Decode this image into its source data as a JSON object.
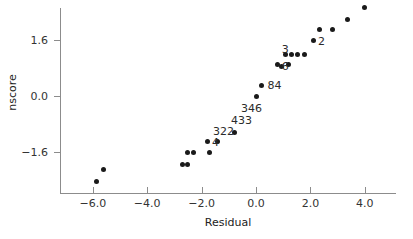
{
  "chart_data": {
    "type": "scatter",
    "title": "",
    "xlabel": "Residual",
    "ylabel": "nscore",
    "xlim": [
      -7.3,
      5.1
    ],
    "ylim": [
      -2.9,
      2.7
    ],
    "xticks": [
      -6.0,
      -4.0,
      -2.0,
      0.0,
      2.0,
      4.0
    ],
    "xtick_labels": [
      "−6.0",
      "−4.0",
      "−2.0",
      "0.0",
      "2.0",
      "4.0"
    ],
    "yticks": [
      1.6,
      0.0,
      -1.6
    ],
    "ytick_labels": [
      "1.6",
      "0.0",
      "−1.6"
    ],
    "grid": false,
    "legend": null,
    "marker": "filled-circle",
    "marker_color": "#1a1a1a",
    "axis_color": "#8c8c8c",
    "points": [
      {
        "x": -5.85,
        "y": -2.45
      },
      {
        "x": -5.6,
        "y": -2.1
      },
      {
        "x": -2.7,
        "y": -1.95
      },
      {
        "x": -2.52,
        "y": -1.95
      },
      {
        "x": -2.52,
        "y": -1.62
      },
      {
        "x": -2.3,
        "y": -1.62
      },
      {
        "x": -1.72,
        "y": -1.62
      },
      {
        "x": -1.78,
        "y": -1.3
      },
      {
        "x": -1.4,
        "y": -1.3
      },
      {
        "x": -0.8,
        "y": -1.05
      },
      {
        "x": 0.0,
        "y": 0.0
      },
      {
        "x": 0.2,
        "y": 0.3
      },
      {
        "x": 0.78,
        "y": 0.9
      },
      {
        "x": 0.92,
        "y": 0.85
      },
      {
        "x": 1.18,
        "y": 0.9
      },
      {
        "x": 1.1,
        "y": 1.2
      },
      {
        "x": 1.32,
        "y": 1.2
      },
      {
        "x": 1.52,
        "y": 1.2
      },
      {
        "x": 1.78,
        "y": 1.2
      },
      {
        "x": 2.12,
        "y": 1.58
      },
      {
        "x": 2.35,
        "y": 1.9
      },
      {
        "x": 2.82,
        "y": 1.9
      },
      {
        "x": 3.38,
        "y": 2.2
      },
      {
        "x": 3.97,
        "y": 2.52
      }
    ],
    "annotations": [
      {
        "text": "3",
        "x": 0.95,
        "y": 1.32
      },
      {
        "text": "6",
        "x": 0.95,
        "y": 0.82
      },
      {
        "text": "2",
        "x": 2.28,
        "y": 1.55
      },
      {
        "text": "84",
        "x": 0.42,
        "y": 0.3
      },
      {
        "text": "346",
        "x": -0.55,
        "y": -0.38
      },
      {
        "text": "433",
        "x": -0.92,
        "y": -0.72
      },
      {
        "text": "322",
        "x": -1.58,
        "y": -1.02
      },
      {
        "text": "4",
        "x": -1.62,
        "y": -1.34
      }
    ]
  }
}
